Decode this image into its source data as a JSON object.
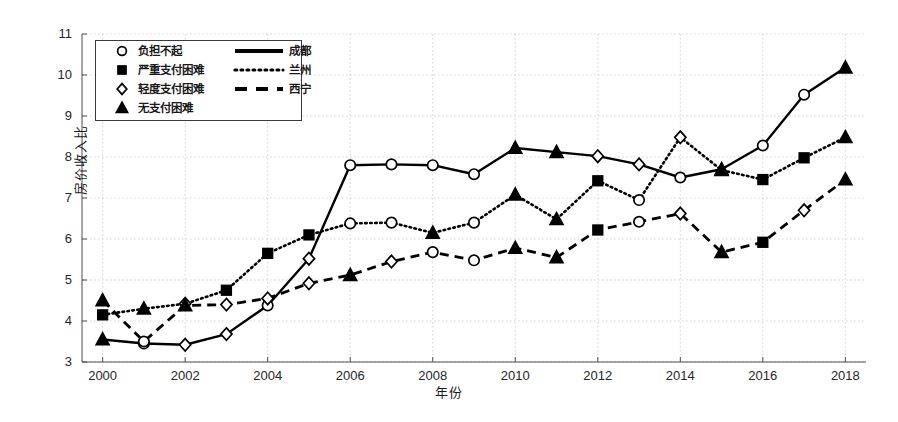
{
  "chart_data": {
    "type": "line",
    "title": "",
    "xlabel": "年份",
    "ylabel": "房价收入比",
    "xlim": [
      1999.5,
      2018.5
    ],
    "ylim": [
      3,
      11
    ],
    "xticks": [
      2000,
      2002,
      2004,
      2006,
      2008,
      2010,
      2012,
      2014,
      2016,
      2018
    ],
    "yticks": [
      3,
      4,
      5,
      6,
      7,
      8,
      9,
      10,
      11
    ],
    "grid": true,
    "legend_position": "upper-left",
    "x": [
      2000,
      2001,
      2002,
      2003,
      2004,
      2005,
      2006,
      2007,
      2008,
      2009,
      2010,
      2011,
      2012,
      2013,
      2014,
      2015,
      2016,
      2017,
      2018
    ],
    "series": [
      {
        "name": "成都",
        "linestyle": "solid",
        "values": [
          3.55,
          3.45,
          3.42,
          3.68,
          4.38,
          5.52,
          7.8,
          7.82,
          7.8,
          7.58,
          8.22,
          8.12,
          8.02,
          7.82,
          7.5,
          7.7,
          8.28,
          9.52,
          10.18
        ],
        "markers": [
          "triangle",
          "circle",
          "diamond",
          "diamond",
          "circle",
          "diamond",
          "circle",
          "circle",
          "circle",
          "circle",
          "triangle",
          "triangle",
          "diamond",
          "diamond",
          "circle",
          "triangle",
          "circle",
          "circle",
          "triangle"
        ]
      },
      {
        "name": "兰州",
        "linestyle": "dotted",
        "values": [
          4.15,
          4.3,
          4.42,
          4.75,
          5.65,
          6.1,
          6.38,
          6.4,
          6.15,
          6.4,
          7.08,
          6.48,
          7.42,
          6.95,
          8.48,
          7.68,
          7.45,
          7.98,
          8.48
        ],
        "markers": [
          "square",
          "triangle",
          "diamond",
          "square",
          "square",
          "square",
          "circle",
          "circle",
          "triangle",
          "circle",
          "triangle",
          "triangle",
          "square",
          "circle",
          "diamond",
          "triangle",
          "square",
          "square",
          "triangle"
        ]
      },
      {
        "name": "西宁",
        "linestyle": "dashed",
        "values": [
          4.5,
          3.5,
          4.38,
          4.4,
          4.55,
          4.92,
          5.12,
          5.45,
          5.68,
          5.48,
          5.78,
          5.55,
          6.22,
          6.42,
          6.62,
          5.68,
          5.92,
          6.7,
          7.45
        ],
        "markers": [
          "triangle",
          "circle",
          "triangle",
          "diamond",
          "diamond",
          "diamond",
          "triangle",
          "diamond",
          "circle",
          "circle",
          "triangle",
          "triangle",
          "square",
          "circle",
          "diamond",
          "triangle",
          "square",
          "diamond",
          "triangle"
        ]
      }
    ]
  },
  "legend": {
    "markers": [
      {
        "shape": "circle",
        "label": "负担不起"
      },
      {
        "shape": "square",
        "label": "严重支付困难"
      },
      {
        "shape": "diamond",
        "label": "轻度支付困难"
      },
      {
        "shape": "triangle",
        "label": "无支付困难"
      }
    ],
    "lines": [
      {
        "style": "solid",
        "label": "成都"
      },
      {
        "style": "dotted",
        "label": "兰州"
      },
      {
        "style": "dashed",
        "label": "西宁"
      }
    ]
  },
  "colors": {
    "line": "#000000",
    "grid": "#c8c8c8",
    "axis": "#4d4d4d",
    "background": "#ffffff"
  }
}
